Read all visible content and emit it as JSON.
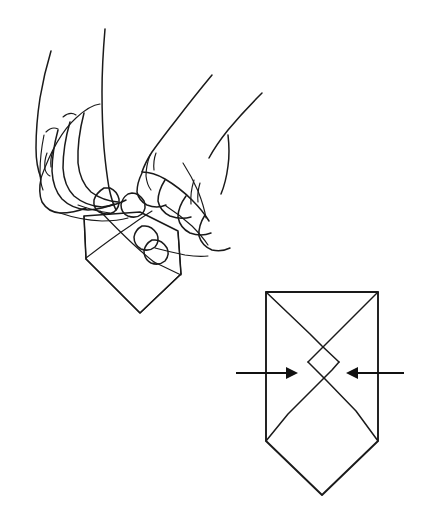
{
  "figure": {
    "title": "Paper folding step: pressing the folded sheet inward from both sides",
    "style": "black-and-white line drawing",
    "background_color": "#ffffff",
    "ink_color": "#1a1a1a",
    "width": 432,
    "height": 526,
    "panels": [
      {
        "id": "hands-panel",
        "name": "hands-holding-paper",
        "description": "Two hands seen from above, fingers curled downward, thumbs and forefingers pinching the top edges of a folded paper form held between them",
        "elements": [
          "left-hand",
          "right-hand",
          "held-paper-form"
        ]
      },
      {
        "id": "diagram-panel",
        "name": "fold-diagram",
        "description": "Geometric diagram of the same paper form: a square with two diagonal crease lines crossing in the middle and a diamond point extending below, with one arrow pushing in from the left and one from the right",
        "elements": [
          "paper-outline",
          "crease-lines",
          "left-push-arrow",
          "right-push-arrow"
        ]
      }
    ]
  },
  "hands": {
    "left_hand": {
      "name": "left-hand",
      "label": "Left hand",
      "fingers": 4,
      "thumb_visible": true,
      "nails_visible": 3
    },
    "right_hand": {
      "name": "right-hand",
      "label": "Right hand",
      "fingers": 4,
      "thumb_visible": true,
      "nails_visible": 3
    }
  },
  "held_paper": {
    "name": "held-paper-form",
    "label": "Folded paper held between the hands",
    "shape": "square with lower diamond point"
  },
  "diagram": {
    "paper": {
      "name": "paper-outline",
      "label": "Folded paper, front view",
      "top_left": [
        266,
        292
      ],
      "top_right": [
        378,
        292
      ],
      "left_waist": [
        266,
        441
      ],
      "right_waist": [
        378,
        441
      ],
      "bottom_point": [
        322,
        495
      ]
    },
    "creases": {
      "name": "crease-lines",
      "label": "Diagonal crease lines forming an X",
      "count": 4,
      "crossing_point": [
        322,
        373
      ]
    },
    "arrows": [
      {
        "name": "left-push-arrow",
        "label": "Push in from the left",
        "direction": "right",
        "tail": [
          236,
          373
        ],
        "tip": [
          292,
          373
        ]
      },
      {
        "name": "right-push-arrow",
        "label": "Push in from the right",
        "direction": "left",
        "tail": [
          404,
          373
        ],
        "tip": [
          352,
          373
        ]
      }
    ]
  }
}
